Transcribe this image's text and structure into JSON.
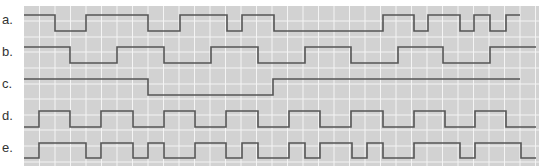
{
  "figure": {
    "width": 546,
    "height": 168,
    "panel": {
      "x": 24,
      "y": 6,
      "width": 515,
      "height": 160,
      "fill": "#d2d2d2"
    },
    "grid": {
      "cell": 15.5,
      "color": "#f4f4f4",
      "h_lines": [
        21,
        37,
        52,
        68,
        84,
        99,
        115,
        130,
        146,
        162
      ]
    },
    "trace_color": "#555555"
  },
  "waveforms": [
    {
      "label": "a.",
      "label_y": 20,
      "high_y": 15,
      "low_y": 31,
      "edges": [
        [
          24,
          "H"
        ],
        [
          55,
          "L"
        ],
        [
          86,
          "H"
        ],
        [
          148,
          "L"
        ],
        [
          180,
          "H"
        ],
        [
          227,
          "L"
        ],
        [
          242,
          "H"
        ],
        [
          274,
          "L"
        ],
        [
          383,
          "H"
        ],
        [
          414,
          "L"
        ],
        [
          428,
          "H"
        ],
        [
          460,
          "L"
        ],
        [
          474,
          "H"
        ],
        [
          490,
          "L"
        ],
        [
          506,
          "H"
        ],
        [
          520,
          "end"
        ]
      ]
    },
    {
      "label": "b.",
      "label_y": 52,
      "high_y": 47,
      "low_y": 63,
      "edges": [
        [
          24,
          "H"
        ],
        [
          70,
          "L"
        ],
        [
          117,
          "H"
        ],
        [
          164,
          "L"
        ],
        [
          211,
          "H"
        ],
        [
          258,
          "L"
        ],
        [
          305,
          "H"
        ],
        [
          351,
          "L"
        ],
        [
          398,
          "H"
        ],
        [
          443,
          "L"
        ],
        [
          490,
          "H"
        ],
        [
          536,
          "end"
        ]
      ]
    },
    {
      "label": "c.",
      "label_y": 84,
      "high_y": 79,
      "low_y": 95,
      "edges": [
        [
          24,
          "H"
        ],
        [
          148,
          "L"
        ],
        [
          273,
          "H"
        ],
        [
          520,
          "end"
        ]
      ]
    },
    {
      "label": "d.",
      "label_y": 116,
      "high_y": 111,
      "low_y": 127,
      "edges": [
        [
          24,
          "L"
        ],
        [
          39,
          "H"
        ],
        [
          70,
          "L"
        ],
        [
          101,
          "H"
        ],
        [
          133,
          "L"
        ],
        [
          164,
          "H"
        ],
        [
          195,
          "L"
        ],
        [
          226,
          "H"
        ],
        [
          258,
          "L"
        ],
        [
          289,
          "H"
        ],
        [
          320,
          "L"
        ],
        [
          351,
          "H"
        ],
        [
          383,
          "L"
        ],
        [
          414,
          "H"
        ],
        [
          445,
          "L"
        ],
        [
          475,
          "H"
        ],
        [
          506,
          "L"
        ],
        [
          536,
          "end"
        ]
      ]
    },
    {
      "label": "e.",
      "label_y": 148,
      "high_y": 143,
      "low_y": 158,
      "edges": [
        [
          24,
          "L"
        ],
        [
          39,
          "H"
        ],
        [
          86,
          "L"
        ],
        [
          101,
          "H"
        ],
        [
          133,
          "L"
        ],
        [
          148,
          "H"
        ],
        [
          164,
          "L"
        ],
        [
          195,
          "H"
        ],
        [
          226,
          "L"
        ],
        [
          242,
          "H"
        ],
        [
          258,
          "L"
        ],
        [
          289,
          "H"
        ],
        [
          305,
          "L"
        ],
        [
          320,
          "H"
        ],
        [
          352,
          "L"
        ],
        [
          367,
          "H"
        ],
        [
          383,
          "L"
        ],
        [
          414,
          "H"
        ],
        [
          460,
          "L"
        ],
        [
          475,
          "H"
        ],
        [
          521,
          "L"
        ],
        [
          536,
          "end"
        ]
      ]
    }
  ]
}
